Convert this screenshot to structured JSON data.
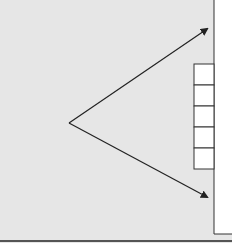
{
  "diagram": {
    "background_color": "#e6e6e6",
    "panel_color": "#ffffff",
    "line_color": "#222222",
    "origin_node": "vertex",
    "arrows": [
      {
        "name": "upper-arrow",
        "direction": "up-right"
      },
      {
        "name": "lower-arrow",
        "direction": "down-right"
      }
    ],
    "stack_cells": 5
  }
}
